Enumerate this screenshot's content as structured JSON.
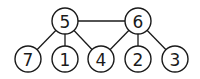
{
  "graph": {
    "nodes": [
      {
        "id": "5",
        "label": "5",
        "x": 65,
        "y": 21
      },
      {
        "id": "6",
        "label": "6",
        "x": 138,
        "y": 21
      },
      {
        "id": "7",
        "label": "7",
        "x": 28,
        "y": 59
      },
      {
        "id": "1",
        "label": "1",
        "x": 65,
        "y": 59
      },
      {
        "id": "4",
        "label": "4",
        "x": 101,
        "y": 59
      },
      {
        "id": "2",
        "label": "2",
        "x": 138,
        "y": 59
      },
      {
        "id": "3",
        "label": "3",
        "x": 175,
        "y": 59
      }
    ],
    "edges": [
      [
        "5",
        "6"
      ],
      [
        "5",
        "7"
      ],
      [
        "5",
        "1"
      ],
      [
        "5",
        "4"
      ],
      [
        "6",
        "4"
      ],
      [
        "6",
        "2"
      ],
      [
        "6",
        "3"
      ]
    ],
    "radius": 13
  }
}
